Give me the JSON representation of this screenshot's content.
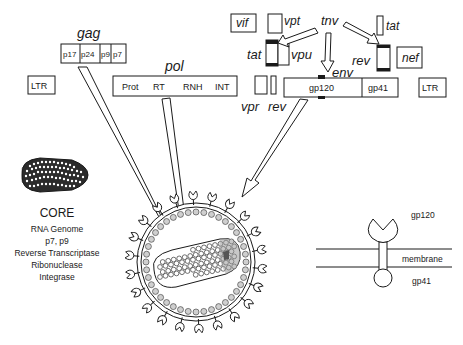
{
  "genome": {
    "gag": {
      "label": "gag",
      "segments": [
        "p17",
        "p24",
        "p9",
        "p7"
      ]
    },
    "pol": {
      "label": "pol",
      "segments": [
        "Prot",
        "RT",
        "RNH",
        "INT"
      ]
    },
    "env": {
      "label": "env",
      "segments": [
        "gp120",
        "gp41"
      ]
    },
    "ltr_left": "LTR",
    "ltr_right": "LTR",
    "vif": "vif",
    "vpt": "vpt",
    "tat_left": "tat",
    "vpu": "vpu",
    "tnv": "tnv",
    "tat_right": "tat",
    "rev_right": "rev",
    "nef": "nef",
    "vpr": "vpr",
    "rev_left": "rev"
  },
  "core": {
    "title": "CORE",
    "components": [
      "RNA Genome",
      "p7, p9",
      "Reverse Transcriptase",
      "Ribonuclease",
      "Integrase"
    ]
  },
  "membrane_inset": {
    "gp120": "gp120",
    "membrane": "membrane",
    "gp41": "gp41"
  },
  "colors": {
    "ink": "#1a1a1a",
    "background": "#ffffff",
    "matrix_dot": "#cfcfcf"
  }
}
